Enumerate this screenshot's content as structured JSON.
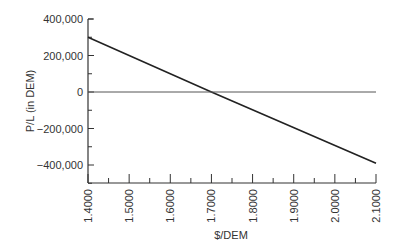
{
  "chart_data": {
    "type": "line",
    "title": "",
    "xlabel": "$/DEM",
    "ylabel": "P/L (in DEM)",
    "xlim": [
      1.4,
      2.1
    ],
    "ylim": [
      -500000,
      400000
    ],
    "x_ticks": [
      "1.4000",
      "1.5000",
      "1.6000",
      "1.7000",
      "1.8000",
      "1.9000",
      "2.0000",
      "2.1000"
    ],
    "y_ticks": [
      "400,000",
      "200,000",
      "0",
      "-200,000",
      "-400,000"
    ],
    "grid": false,
    "legend": null,
    "series": [
      {
        "name": "P/L",
        "x": [
          1.4,
          1.7,
          2.1
        ],
        "values": [
          300000,
          0,
          -390000
        ],
        "color": "#222222"
      },
      {
        "name": "Zero line",
        "x": [
          1.4,
          2.1
        ],
        "values": [
          0,
          0
        ],
        "color": "#555555"
      }
    ]
  }
}
